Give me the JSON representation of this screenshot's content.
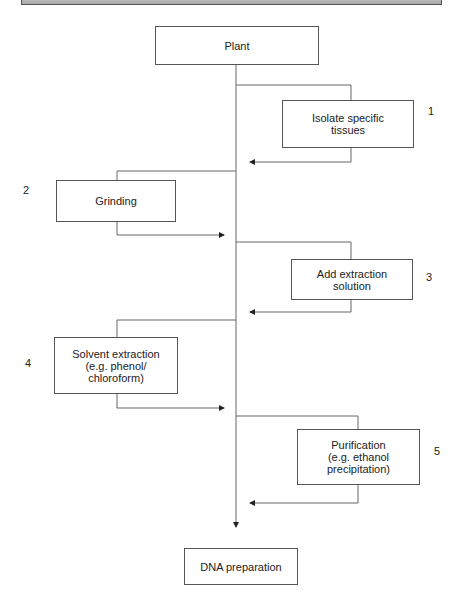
{
  "diagram": {
    "type": "flowchart",
    "start": "Plant",
    "end": "DNA preparation",
    "steps": [
      {
        "number": "1",
        "label": "Isolate specific\ntissues",
        "side": "right"
      },
      {
        "number": "2",
        "label": "Grinding",
        "side": "left"
      },
      {
        "number": "3",
        "label": "Add extraction\nsolution",
        "side": "right"
      },
      {
        "number": "4",
        "label": "Solvent extraction\n(e.g. phenol/\nchloroform)",
        "side": "left"
      },
      {
        "number": "5",
        "label": "Purification\n(e.g. ethanol\nprecipitation)",
        "side": "right"
      }
    ]
  }
}
